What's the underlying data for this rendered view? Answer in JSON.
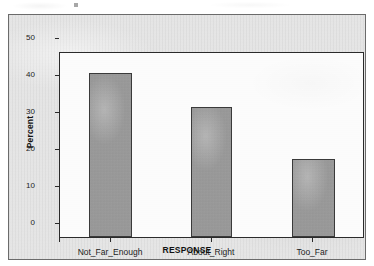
{
  "chart_data": {
    "type": "bar",
    "title": "",
    "subtitle": "",
    "xlabel": "RESPONSE",
    "ylabel": "Percent",
    "categories": [
      "Not_Far_Enough",
      "About_Right",
      "Too_Far"
    ],
    "values": [
      44,
      35,
      21
    ],
    "ylim": [
      0,
      50
    ],
    "yticks": [
      0,
      10,
      20,
      30,
      40,
      50
    ],
    "ytick_labels": [
      "0",
      "10",
      "20",
      "30",
      "40",
      "50"
    ],
    "grid": false,
    "legend": null,
    "legend_position": "none",
    "series": [
      {
        "name": "Percent",
        "values": [
          44,
          35,
          21
        ]
      }
    ],
    "annotations": [],
    "colors": {
      "bar_fill": "#989898",
      "bar_border": "#3a3a3a",
      "plot_background": "#fdfdfd",
      "figure_background": "#e3e3e3",
      "axis": "#2b2b2b",
      "text": "#1c1c1c"
    }
  }
}
